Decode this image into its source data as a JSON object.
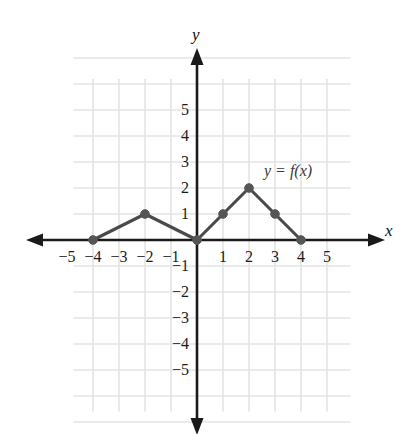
{
  "chart_data": {
    "type": "line",
    "title": "",
    "xlabel": "x",
    "ylabel": "y",
    "curve_label": "y = f(x)",
    "grid": true,
    "legend_position": "inline-right",
    "xlim": [
      -5.6,
      5.6
    ],
    "ylim": [
      -6.2,
      6.2
    ],
    "xticks": [
      -5,
      -4,
      -3,
      -2,
      -1,
      1,
      2,
      3,
      4,
      5
    ],
    "yticks": [
      5,
      4,
      3,
      2,
      1,
      -1,
      -2,
      -3,
      -4,
      -5
    ],
    "xtick_labels": [
      "−5",
      "−4",
      "−3",
      "−2",
      "−1",
      "1",
      "2",
      "3",
      "4",
      "5"
    ],
    "ytick_labels": [
      "5",
      "4",
      "3",
      "2",
      "1",
      "−1",
      "−2",
      "−3",
      "−4",
      "−5"
    ],
    "series": [
      {
        "name": "y = f(x)",
        "marker": "filled-circle",
        "points": [
          {
            "x": -4,
            "y": 0
          },
          {
            "x": -2,
            "y": 1
          },
          {
            "x": 0,
            "y": 0
          },
          {
            "x": 1,
            "y": 1
          },
          {
            "x": 2,
            "y": 2
          },
          {
            "x": 3,
            "y": 1
          },
          {
            "x": 4,
            "y": 0
          }
        ]
      }
    ],
    "colors": {
      "curve": "#4a4a4a",
      "marker": "#555555",
      "axis": "#1a1a1a",
      "grid": "#e4e4e4",
      "tick_text": "#1c1c1c",
      "curve_label_text": "#3a3a3a"
    },
    "geometry": {
      "origin_x": 197,
      "origin_y": 240,
      "unit": 26,
      "grid_left": -4.75,
      "grid_right": 5.9,
      "grid_top": 6.2,
      "grid_bottom": -6.6,
      "x_axis_end": 376,
      "y_axis_top": 57,
      "y_axis_bottom": 426
    },
    "axis_label_positions": {
      "y": {
        "left": 192,
        "top": 26
      },
      "x": {
        "left": 385,
        "top": 222
      }
    },
    "curve_label_position": {
      "left": 264,
      "top": 163
    }
  }
}
